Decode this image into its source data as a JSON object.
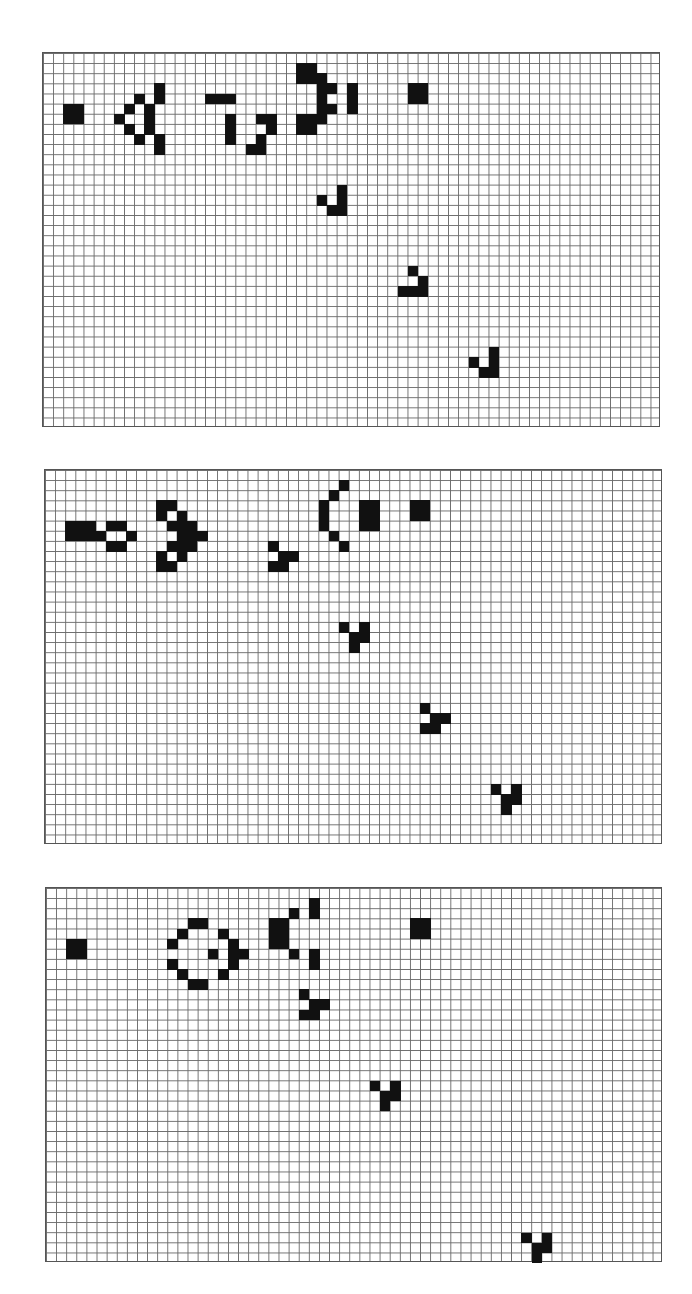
{
  "colors": {
    "live_cell": "#111111",
    "grid_line": "#6a6a6a",
    "background": "#ffffff"
  },
  "grid_spec": {
    "cols": 61,
    "rows": 37,
    "cell_w": 10.13,
    "cell_h": 10.13
  },
  "panels": [
    {
      "name": "generation-panel-1",
      "x": 42,
      "y": 52,
      "w": 618,
      "h": 375,
      "cells": [
        [
          5,
          2
        ],
        [
          5,
          3
        ],
        [
          6,
          2
        ],
        [
          6,
          3
        ],
        [
          3,
          11
        ],
        [
          4,
          11
        ],
        [
          4,
          9
        ],
        [
          5,
          8
        ],
        [
          5,
          10
        ],
        [
          6,
          7
        ],
        [
          6,
          10
        ],
        [
          7,
          8
        ],
        [
          7,
          10
        ],
        [
          8,
          9
        ],
        [
          8,
          11
        ],
        [
          9,
          11
        ],
        [
          4,
          16
        ],
        [
          4,
          17
        ],
        [
          4,
          18
        ],
        [
          6,
          18
        ],
        [
          7,
          18
        ],
        [
          8,
          18
        ],
        [
          6,
          21
        ],
        [
          6,
          22
        ],
        [
          7,
          22
        ],
        [
          8,
          21
        ],
        [
          9,
          20
        ],
        [
          9,
          21
        ],
        [
          1,
          25
        ],
        [
          1,
          26
        ],
        [
          2,
          25
        ],
        [
          2,
          26
        ],
        [
          2,
          27
        ],
        [
          3,
          27
        ],
        [
          3,
          28
        ],
        [
          4,
          27
        ],
        [
          5,
          27
        ],
        [
          5,
          28
        ],
        [
          6,
          25
        ],
        [
          6,
          26
        ],
        [
          6,
          27
        ],
        [
          7,
          25
        ],
        [
          7,
          26
        ],
        [
          3,
          30
        ],
        [
          4,
          30
        ],
        [
          5,
          30
        ],
        [
          3,
          36
        ],
        [
          3,
          37
        ],
        [
          4,
          36
        ],
        [
          4,
          37
        ],
        [
          13,
          29
        ],
        [
          14,
          27
        ],
        [
          14,
          29
        ],
        [
          15,
          28
        ],
        [
          15,
          29
        ],
        [
          21,
          36
        ],
        [
          22,
          37
        ],
        [
          23,
          35
        ],
        [
          23,
          36
        ],
        [
          23,
          37
        ],
        [
          29,
          44
        ],
        [
          30,
          42
        ],
        [
          30,
          44
        ],
        [
          31,
          43
        ],
        [
          31,
          44
        ]
      ]
    },
    {
      "name": "generation-panel-2",
      "x": 44,
      "y": 469,
      "w": 618,
      "h": 375,
      "cells": [
        [
          5,
          2
        ],
        [
          5,
          3
        ],
        [
          5,
          4
        ],
        [
          6,
          2
        ],
        [
          6,
          3
        ],
        [
          6,
          4
        ],
        [
          6,
          5
        ],
        [
          5,
          6
        ],
        [
          5,
          7
        ],
        [
          6,
          8
        ],
        [
          7,
          6
        ],
        [
          7,
          7
        ],
        [
          3,
          11
        ],
        [
          3,
          12
        ],
        [
          4,
          11
        ],
        [
          4,
          13
        ],
        [
          5,
          12
        ],
        [
          5,
          13
        ],
        [
          5,
          14
        ],
        [
          6,
          13
        ],
        [
          6,
          14
        ],
        [
          6,
          15
        ],
        [
          7,
          12
        ],
        [
          7,
          13
        ],
        [
          7,
          14
        ],
        [
          8,
          11
        ],
        [
          8,
          13
        ],
        [
          9,
          11
        ],
        [
          9,
          12
        ],
        [
          7,
          22
        ],
        [
          8,
          23
        ],
        [
          8,
          24
        ],
        [
          9,
          22
        ],
        [
          9,
          23
        ],
        [
          1,
          29
        ],
        [
          2,
          28
        ],
        [
          3,
          27
        ],
        [
          4,
          27
        ],
        [
          5,
          27
        ],
        [
          6,
          28
        ],
        [
          7,
          29
        ],
        [
          3,
          31
        ],
        [
          3,
          32
        ],
        [
          4,
          31
        ],
        [
          4,
          32
        ],
        [
          5,
          31
        ],
        [
          5,
          32
        ],
        [
          3,
          36
        ],
        [
          3,
          37
        ],
        [
          4,
          36
        ],
        [
          4,
          37
        ],
        [
          15,
          29
        ],
        [
          15,
          31
        ],
        [
          16,
          30
        ],
        [
          16,
          31
        ],
        [
          17,
          30
        ],
        [
          23,
          37
        ],
        [
          24,
          38
        ],
        [
          24,
          39
        ],
        [
          25,
          37
        ],
        [
          25,
          38
        ],
        [
          31,
          44
        ],
        [
          31,
          46
        ],
        [
          32,
          45
        ],
        [
          32,
          46
        ],
        [
          33,
          45
        ]
      ]
    },
    {
      "name": "generation-panel-3",
      "x": 45,
      "y": 887,
      "w": 617,
      "h": 375,
      "cells": [
        [
          5,
          2
        ],
        [
          5,
          3
        ],
        [
          6,
          2
        ],
        [
          6,
          3
        ],
        [
          3,
          14
        ],
        [
          3,
          15
        ],
        [
          4,
          13
        ],
        [
          4,
          17
        ],
        [
          5,
          12
        ],
        [
          5,
          18
        ],
        [
          6,
          16
        ],
        [
          6,
          18
        ],
        [
          6,
          19
        ],
        [
          7,
          12
        ],
        [
          7,
          18
        ],
        [
          8,
          13
        ],
        [
          8,
          17
        ],
        [
          9,
          14
        ],
        [
          9,
          15
        ],
        [
          3,
          22
        ],
        [
          3,
          23
        ],
        [
          4,
          22
        ],
        [
          4,
          23
        ],
        [
          5,
          22
        ],
        [
          5,
          23
        ],
        [
          1,
          26
        ],
        [
          2,
          24
        ],
        [
          2,
          26
        ],
        [
          6,
          24
        ],
        [
          6,
          26
        ],
        [
          7,
          26
        ],
        [
          10,
          25
        ],
        [
          11,
          26
        ],
        [
          11,
          27
        ],
        [
          12,
          25
        ],
        [
          12,
          26
        ],
        [
          3,
          36
        ],
        [
          3,
          37
        ],
        [
          4,
          36
        ],
        [
          4,
          37
        ],
        [
          19,
          32
        ],
        [
          19,
          34
        ],
        [
          20,
          33
        ],
        [
          20,
          34
        ],
        [
          21,
          33
        ],
        [
          34,
          47
        ],
        [
          34,
          49
        ],
        [
          35,
          48
        ],
        [
          35,
          49
        ],
        [
          36,
          48
        ]
      ]
    }
  ]
}
